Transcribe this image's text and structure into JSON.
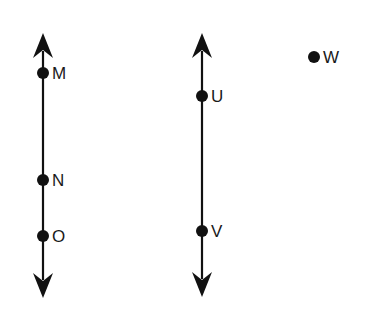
{
  "diagram": {
    "type": "geometry-lines-and-points",
    "colors": {
      "stroke": "#111111",
      "label": "#1a1a1a",
      "background": "#ffffff"
    },
    "lines": [
      {
        "id": "line-left",
        "x": 43,
        "y_top": 33,
        "y_bottom": 298,
        "arrows": "both",
        "points": [
          {
            "label": "M",
            "x": 43,
            "y": 73
          },
          {
            "label": "N",
            "x": 43,
            "y": 180
          },
          {
            "label": "O",
            "x": 43,
            "y": 236
          }
        ]
      },
      {
        "id": "line-middle",
        "x": 202,
        "y_top": 33,
        "y_bottom": 297,
        "arrows": "both",
        "points": [
          {
            "label": "U",
            "x": 202,
            "y": 96
          },
          {
            "label": "V",
            "x": 202,
            "y": 231
          }
        ]
      }
    ],
    "standalone_points": [
      {
        "label": "W",
        "x": 314,
        "y": 57
      }
    ]
  }
}
